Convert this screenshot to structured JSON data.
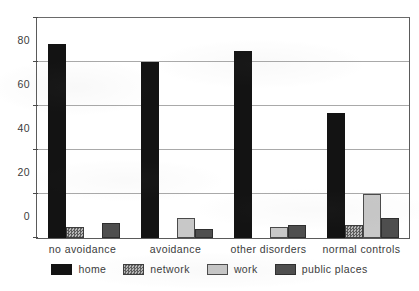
{
  "chart_data": {
    "type": "bar",
    "title": "",
    "xlabel": "",
    "ylabel": "",
    "ylim": [
      0,
      100
    ],
    "yticks": [
      0,
      20,
      40,
      60,
      80,
      100
    ],
    "grid": true,
    "legend_position": "bottom",
    "categories": [
      "no avoidance",
      "avoidance",
      "other disorders",
      "normal controls"
    ],
    "series": [
      {
        "name": "home",
        "color": "#131313",
        "values": [
          88,
          80,
          85,
          57
        ]
      },
      {
        "name": "network",
        "color": "#7d7d7d",
        "values": [
          5,
          0,
          0,
          6
        ]
      },
      {
        "name": "work",
        "color": "#c8c8c8",
        "values": [
          0,
          9,
          5,
          20
        ]
      },
      {
        "name": "public places",
        "color": "#4e4e4e",
        "values": [
          7,
          4,
          6,
          9
        ]
      }
    ]
  },
  "axis": {
    "y_tick_labels": [
      "0",
      "20",
      "40",
      "60",
      "80",
      "100"
    ]
  },
  "legend": {
    "items": [
      {
        "label": "home"
      },
      {
        "label": "network"
      },
      {
        "label": "work"
      },
      {
        "label": "public places"
      }
    ]
  }
}
